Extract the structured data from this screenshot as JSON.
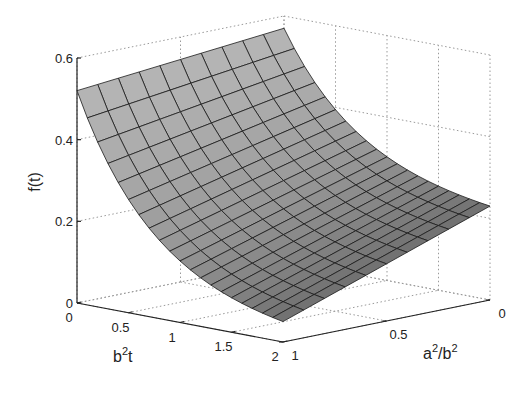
{
  "chart_data": {
    "type": "surface",
    "title": "",
    "xlabel": "b^2t",
    "ylabel": "a^2/b^2",
    "zlabel": "f(t)",
    "x_axis": {
      "name": "b^2t",
      "range": [
        0,
        2
      ],
      "ticks": [
        0,
        0.5,
        1,
        1.5,
        2
      ],
      "tick_labels": [
        "0",
        "0.5",
        "1",
        "1.5",
        "2"
      ]
    },
    "y_axis": {
      "name": "a^2/b^2",
      "range": [
        0,
        1
      ],
      "ticks": [
        0,
        0.5,
        1
      ],
      "tick_labels": [
        "0",
        "0.5",
        "1"
      ]
    },
    "z_axis": {
      "name": "f(t)",
      "range": [
        0,
        0.6
      ],
      "ticks": [
        0,
        0.2,
        0.4,
        0.6
      ],
      "tick_labels": [
        "0",
        "0.2",
        "0.4",
        "0.6"
      ]
    },
    "grid": true,
    "grid_style": "dotted",
    "mesh": {
      "x_steps": 20,
      "y_steps": 10
    },
    "corner_values": [
      {
        "b2t": 0,
        "a2b2": 0,
        "f": 0.57
      },
      {
        "b2t": 0,
        "a2b2": 1,
        "f": 0.52
      },
      {
        "b2t": 2,
        "a2b2": 0,
        "f": 0.23
      },
      {
        "b2t": 2,
        "a2b2": 1,
        "f": 0.05
      }
    ],
    "surface_color": "#a6a6a6",
    "edge_color": "#1a1a1a"
  },
  "labels": {
    "z_title": "f(t)",
    "x_title_base": "b",
    "x_title_sup": "2",
    "x_title_tail": "t",
    "y_title_a": "a",
    "y_title_sup1": "2",
    "y_title_mid": "/b",
    "y_title_sup2": "2"
  }
}
